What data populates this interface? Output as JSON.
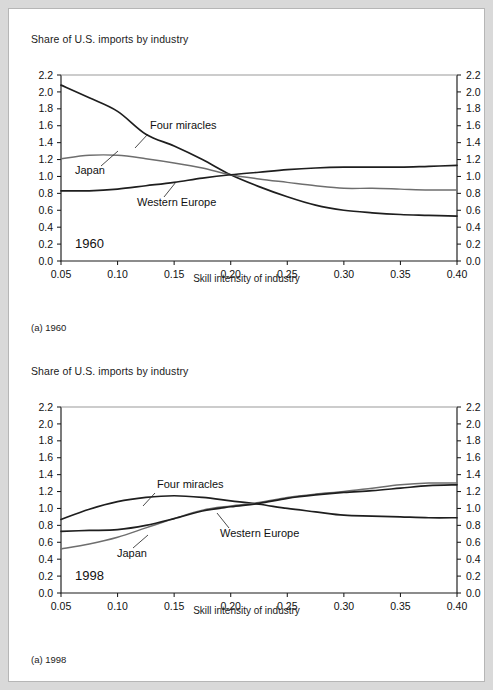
{
  "figure": {
    "background_color": "#d9d9d9",
    "panel_color": "#ffffff",
    "border_color": "#b6b6b6"
  },
  "panels": [
    {
      "id": "panel-1960",
      "axis_title": "Share of U.S. imports by industry",
      "xlabel": "Skill intensity of industry",
      "year_annotation": "1960",
      "caption": "(a) 1960"
    },
    {
      "id": "panel-1998",
      "axis_title": "Share of U.S. imports by industry",
      "xlabel": "Skill intensity of industry",
      "year_annotation": "1998",
      "caption": "(a) 1998"
    }
  ],
  "axis": {
    "y_ticks": [
      "0.0",
      "0.2",
      "0.4",
      "0.6",
      "0.8",
      "1.0",
      "1.2",
      "1.4",
      "1.6",
      "1.8",
      "2.0",
      "2.2"
    ],
    "x_ticks": [
      "0.05",
      "0.10",
      "0.15",
      "0.20",
      "0.25",
      "0.30",
      "0.35",
      "0.40"
    ]
  },
  "series_labels": {
    "four_miracles": "Four miracles",
    "japan": "Japan",
    "western_europe": "Western Europe"
  },
  "chart_data": [
    {
      "type": "line",
      "title": "Share of U.S. imports by industry",
      "subtitle": "1960",
      "caption": "(a) 1960",
      "xlabel": "Skill intensity of industry",
      "ylabel": "Share of U.S. imports by industry",
      "xlim": [
        0.05,
        0.4
      ],
      "ylim": [
        0.0,
        2.2
      ],
      "ytick_step": 0.2,
      "xtick_step": 0.05,
      "grid": false,
      "legend": "inline-annotations",
      "dual_y_axis": true,
      "x": [
        0.05,
        0.075,
        0.1,
        0.125,
        0.15,
        0.175,
        0.2,
        0.225,
        0.25,
        0.275,
        0.3,
        0.325,
        0.35,
        0.375,
        0.4
      ],
      "series": [
        {
          "name": "Four miracles",
          "color": "#1e1e1e",
          "values": [
            2.08,
            1.93,
            1.77,
            1.5,
            1.36,
            1.2,
            1.02,
            0.88,
            0.76,
            0.66,
            0.6,
            0.57,
            0.55,
            0.54,
            0.53
          ]
        },
        {
          "name": "Japan",
          "color": "#6e6e6e",
          "values": [
            1.21,
            1.25,
            1.25,
            1.21,
            1.16,
            1.1,
            1.02,
            0.97,
            0.93,
            0.89,
            0.86,
            0.86,
            0.85,
            0.84,
            0.84
          ]
        },
        {
          "name": "Western Europe",
          "color": "#1e1e1e",
          "values": [
            0.83,
            0.83,
            0.85,
            0.89,
            0.93,
            0.98,
            1.02,
            1.05,
            1.08,
            1.1,
            1.11,
            1.11,
            1.11,
            1.12,
            1.13
          ]
        }
      ]
    },
    {
      "type": "line",
      "title": "Share of U.S. imports by industry",
      "subtitle": "1998",
      "caption": "(a) 1998",
      "xlabel": "Skill intensity of industry",
      "ylabel": "Share of U.S. imports by industry",
      "xlim": [
        0.05,
        0.4
      ],
      "ylim": [
        0.0,
        2.2
      ],
      "ytick_step": 0.2,
      "xtick_step": 0.05,
      "grid": false,
      "legend": "inline-annotations",
      "dual_y_axis": true,
      "x": [
        0.05,
        0.075,
        0.1,
        0.125,
        0.15,
        0.175,
        0.2,
        0.225,
        0.25,
        0.275,
        0.3,
        0.325,
        0.35,
        0.375,
        0.4
      ],
      "series": [
        {
          "name": "Four miracles",
          "color": "#1e1e1e",
          "values": [
            0.87,
            0.99,
            1.08,
            1.13,
            1.15,
            1.13,
            1.09,
            1.05,
            1.0,
            0.96,
            0.92,
            0.91,
            0.9,
            0.89,
            0.89
          ]
        },
        {
          "name": "Japan",
          "color": "#6e6e6e",
          "values": [
            0.52,
            0.58,
            0.66,
            0.77,
            0.88,
            0.98,
            1.03,
            1.07,
            1.13,
            1.17,
            1.2,
            1.24,
            1.28,
            1.3,
            1.3
          ]
        },
        {
          "name": "Western Europe",
          "color": "#1e1e1e",
          "values": [
            0.73,
            0.74,
            0.75,
            0.8,
            0.88,
            0.97,
            1.02,
            1.06,
            1.12,
            1.16,
            1.19,
            1.21,
            1.24,
            1.27,
            1.28
          ]
        }
      ]
    }
  ]
}
